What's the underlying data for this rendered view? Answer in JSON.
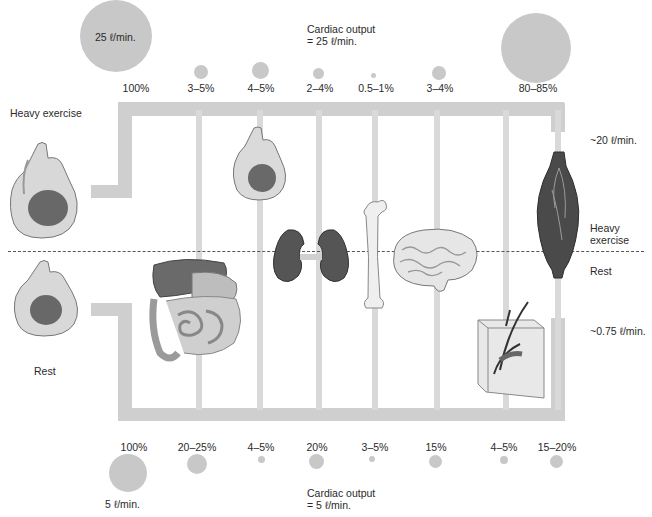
{
  "exercise": {
    "label": "Heavy exercise",
    "cardiac_output_line1": "Cardiac output",
    "cardiac_output_line2": "= 25 ℓ/min.",
    "total_circle_label": "25 ℓ/min.",
    "muscle_flow": "~20 ℓ/min.",
    "organs": [
      {
        "organ": "total",
        "percent": "100%"
      },
      {
        "organ": "digestive tract",
        "percent": "3–5%"
      },
      {
        "organ": "heart",
        "percent": "4–5%"
      },
      {
        "organ": "kidneys",
        "percent": "2–4%"
      },
      {
        "organ": "bone",
        "percent": "0.5–1%"
      },
      {
        "organ": "brain",
        "percent": "3–4%"
      },
      {
        "organ": "skeletal muscle",
        "percent": "80–85%"
      }
    ]
  },
  "rest": {
    "label": "Rest",
    "cardiac_output_line1": "Cardiac output",
    "cardiac_output_line2": "= 5 ℓ/min.",
    "total_circle_label": "5 ℓ/min.",
    "muscle_flow": "~0.75 ℓ/min.",
    "organs": [
      {
        "organ": "total",
        "percent": "100%"
      },
      {
        "organ": "digestive tract",
        "percent": "20–25%"
      },
      {
        "organ": "heart",
        "percent": "4–5%"
      },
      {
        "organ": "kidneys",
        "percent": "20%"
      },
      {
        "organ": "bone",
        "percent": "3–5%"
      },
      {
        "organ": "brain",
        "percent": "15%"
      },
      {
        "organ": "skin",
        "percent": "4–5%"
      },
      {
        "organ": "skeletal muscle",
        "percent": "15–20%"
      }
    ]
  },
  "divider_labels": {
    "upper_line1": "Heavy",
    "upper_line2": "exercise",
    "lower": "Rest"
  },
  "colors": {
    "pipe": "#cfcfcf",
    "circle": "#c8c8c8",
    "organ_dark": "#5a5a5a"
  }
}
